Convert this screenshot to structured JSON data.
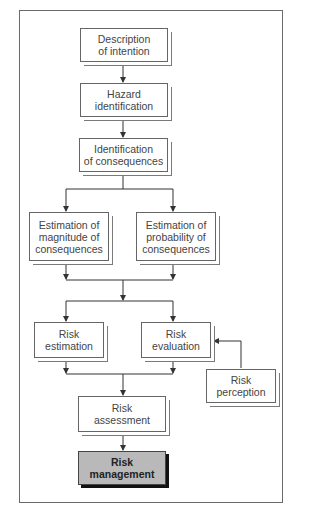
{
  "diagram": {
    "nodes": {
      "description": "Description\nof intention",
      "hazard": "Hazard\nidentification",
      "consequences": "Identification\nof consequences",
      "magnitude": "Estimation of\nmagnitude of\nconsequences",
      "probability": "Estimation of\nprobability of\nconsequences",
      "risk_estimation": "Risk\nestimation",
      "risk_evaluation": "Risk\nevaluation",
      "risk_perception": "Risk\nperception",
      "risk_assessment": "Risk\nassessment",
      "risk_management": "Risk\nmanagement"
    },
    "edges": [
      [
        "description",
        "hazard"
      ],
      [
        "hazard",
        "consequences"
      ],
      [
        "consequences",
        "magnitude"
      ],
      [
        "consequences",
        "probability"
      ],
      [
        "magnitude",
        "risk_estimation"
      ],
      [
        "magnitude",
        "risk_evaluation"
      ],
      [
        "probability",
        "risk_estimation"
      ],
      [
        "probability",
        "risk_evaluation"
      ],
      [
        "risk_perception",
        "risk_evaluation"
      ],
      [
        "risk_estimation",
        "risk_assessment"
      ],
      [
        "risk_evaluation",
        "risk_assessment"
      ],
      [
        "risk_assessment",
        "risk_management"
      ]
    ],
    "colors": {
      "highlight_fill": "#b9b9b9",
      "line": "#333333"
    }
  }
}
